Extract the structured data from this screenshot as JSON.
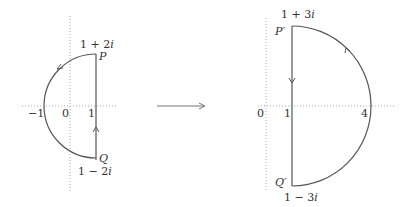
{
  "left": {
    "axis_labels": {
      "neg_one": "−1",
      "zero": "0",
      "one": "1"
    },
    "points": {
      "P": {
        "name": "P",
        "value": "1 + 2i",
        "re": "1 + 2",
        "im": "i"
      },
      "Q": {
        "name": "Q",
        "value": "1 − 2i",
        "re": "1 − 2",
        "im": "i"
      }
    }
  },
  "right": {
    "axis_labels": {
      "zero": "0",
      "one": "1",
      "four": "4"
    },
    "points": {
      "P": {
        "name": "P′",
        "value": "1 + 3i",
        "re": "1 + 3",
        "im": "i"
      },
      "Q": {
        "name": "Q′",
        "value": "1 − 3i",
        "re": "1 − 3",
        "im": "i"
      }
    }
  },
  "colors": {
    "stroke": "#555555",
    "axis": "#aaaaaa",
    "text": "#333333"
  }
}
